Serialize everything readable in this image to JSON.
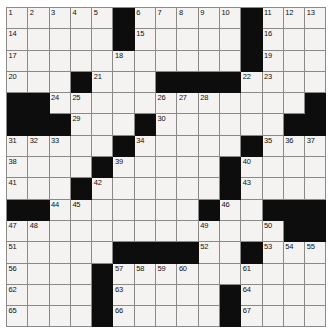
{
  "puzzle": {
    "kind": "crossword-grid",
    "rows": 15,
    "columns": 15,
    "cell_size_px": 21.3,
    "colors": {
      "white_cell": "#f4f3f1",
      "black_cell": "#0d0d0d",
      "grid_line": "#8a8a8a",
      "number_text": "#101010",
      "page_background": "#ffffff"
    },
    "black_squares": [
      [
        1,
        6
      ],
      [
        1,
        12
      ],
      [
        2,
        6
      ],
      [
        2,
        12
      ],
      [
        3,
        12
      ],
      [
        4,
        4
      ],
      [
        4,
        8
      ],
      [
        4,
        9
      ],
      [
        4,
        10
      ],
      [
        4,
        11
      ],
      [
        5,
        1
      ],
      [
        5,
        2
      ],
      [
        5,
        15
      ],
      [
        6,
        1
      ],
      [
        6,
        2
      ],
      [
        6,
        3
      ],
      [
        6,
        7
      ],
      [
        6,
        14
      ],
      [
        6,
        15
      ],
      [
        7,
        6
      ],
      [
        7,
        12
      ],
      [
        8,
        5
      ],
      [
        8,
        11
      ],
      [
        9,
        4
      ],
      [
        9,
        11
      ],
      [
        10,
        1
      ],
      [
        10,
        2
      ],
      [
        10,
        10
      ],
      [
        10,
        13
      ],
      [
        10,
        14
      ],
      [
        10,
        15
      ],
      [
        11,
        14
      ],
      [
        11,
        15
      ],
      [
        12,
        6
      ],
      [
        12,
        7
      ],
      [
        12,
        8
      ],
      [
        12,
        9
      ],
      [
        12,
        12
      ],
      [
        13,
        5
      ],
      [
        14,
        5
      ],
      [
        14,
        11
      ],
      [
        15,
        5
      ],
      [
        15,
        11
      ]
    ],
    "numbered_cells": [
      {
        "number": 1,
        "row": 1,
        "col": 1
      },
      {
        "number": 2,
        "row": 1,
        "col": 2
      },
      {
        "number": 3,
        "row": 1,
        "col": 3
      },
      {
        "number": 4,
        "row": 1,
        "col": 4
      },
      {
        "number": 5,
        "row": 1,
        "col": 5
      },
      {
        "number": 6,
        "row": 1,
        "col": 7
      },
      {
        "number": 7,
        "row": 1,
        "col": 8
      },
      {
        "number": 8,
        "row": 1,
        "col": 9
      },
      {
        "number": 9,
        "row": 1,
        "col": 10
      },
      {
        "number": 10,
        "row": 1,
        "col": 11
      },
      {
        "number": 11,
        "row": 1,
        "col": 13
      },
      {
        "number": 12,
        "row": 1,
        "col": 14
      },
      {
        "number": 13,
        "row": 1,
        "col": 15
      },
      {
        "number": 14,
        "row": 2,
        "col": 1
      },
      {
        "number": 15,
        "row": 2,
        "col": 7
      },
      {
        "number": 16,
        "row": 2,
        "col": 13
      },
      {
        "number": 17,
        "row": 3,
        "col": 1
      },
      {
        "number": 18,
        "row": 3,
        "col": 6
      },
      {
        "number": 19,
        "row": 3,
        "col": 13
      },
      {
        "number": 20,
        "row": 4,
        "col": 1
      },
      {
        "number": 21,
        "row": 4,
        "col": 5
      },
      {
        "number": 22,
        "row": 4,
        "col": 12
      },
      {
        "number": 23,
        "row": 4,
        "col": 13
      },
      {
        "number": 24,
        "row": 5,
        "col": 3
      },
      {
        "number": 25,
        "row": 5,
        "col": 4
      },
      {
        "number": 26,
        "row": 5,
        "col": 8
      },
      {
        "number": 27,
        "row": 5,
        "col": 9
      },
      {
        "number": 28,
        "row": 5,
        "col": 10
      },
      {
        "number": 29,
        "row": 6,
        "col": 4
      },
      {
        "number": 30,
        "row": 6,
        "col": 8
      },
      {
        "number": 31,
        "row": 7,
        "col": 1
      },
      {
        "number": 32,
        "row": 7,
        "col": 2
      },
      {
        "number": 33,
        "row": 7,
        "col": 3
      },
      {
        "number": 34,
        "row": 7,
        "col": 7
      },
      {
        "number": 35,
        "row": 7,
        "col": 13
      },
      {
        "number": 36,
        "row": 7,
        "col": 14
      },
      {
        "number": 37,
        "row": 7,
        "col": 15
      },
      {
        "number": 38,
        "row": 8,
        "col": 1
      },
      {
        "number": 39,
        "row": 8,
        "col": 6
      },
      {
        "number": 40,
        "row": 8,
        "col": 12
      },
      {
        "number": 41,
        "row": 9,
        "col": 1
      },
      {
        "number": 42,
        "row": 9,
        "col": 5
      },
      {
        "number": 43,
        "row": 9,
        "col": 12
      },
      {
        "number": 44,
        "row": 10,
        "col": 3
      },
      {
        "number": 45,
        "row": 10,
        "col": 4
      },
      {
        "number": 46,
        "row": 10,
        "col": 11
      },
      {
        "number": 47,
        "row": 11,
        "col": 1
      },
      {
        "number": 48,
        "row": 11,
        "col": 2
      },
      {
        "number": 49,
        "row": 11,
        "col": 10
      },
      {
        "number": 50,
        "row": 11,
        "col": 13
      },
      {
        "number": 51,
        "row": 12,
        "col": 1
      },
      {
        "number": 52,
        "row": 12,
        "col": 10
      },
      {
        "number": 53,
        "row": 12,
        "col": 13
      },
      {
        "number": 54,
        "row": 12,
        "col": 14
      },
      {
        "number": 55,
        "row": 12,
        "col": 15
      },
      {
        "number": 56,
        "row": 13,
        "col": 1
      },
      {
        "number": 57,
        "row": 13,
        "col": 6
      },
      {
        "number": 58,
        "row": 13,
        "col": 7
      },
      {
        "number": 59,
        "row": 13,
        "col": 8
      },
      {
        "number": 60,
        "row": 13,
        "col": 9
      },
      {
        "number": 61,
        "row": 13,
        "col": 12
      },
      {
        "number": 62,
        "row": 14,
        "col": 1
      },
      {
        "number": 63,
        "row": 14,
        "col": 6
      },
      {
        "number": 64,
        "row": 14,
        "col": 12
      },
      {
        "number": 65,
        "row": 15,
        "col": 1
      },
      {
        "number": 66,
        "row": 15,
        "col": 6
      },
      {
        "number": 67,
        "row": 15,
        "col": 12
      }
    ],
    "filled_letters": []
  }
}
